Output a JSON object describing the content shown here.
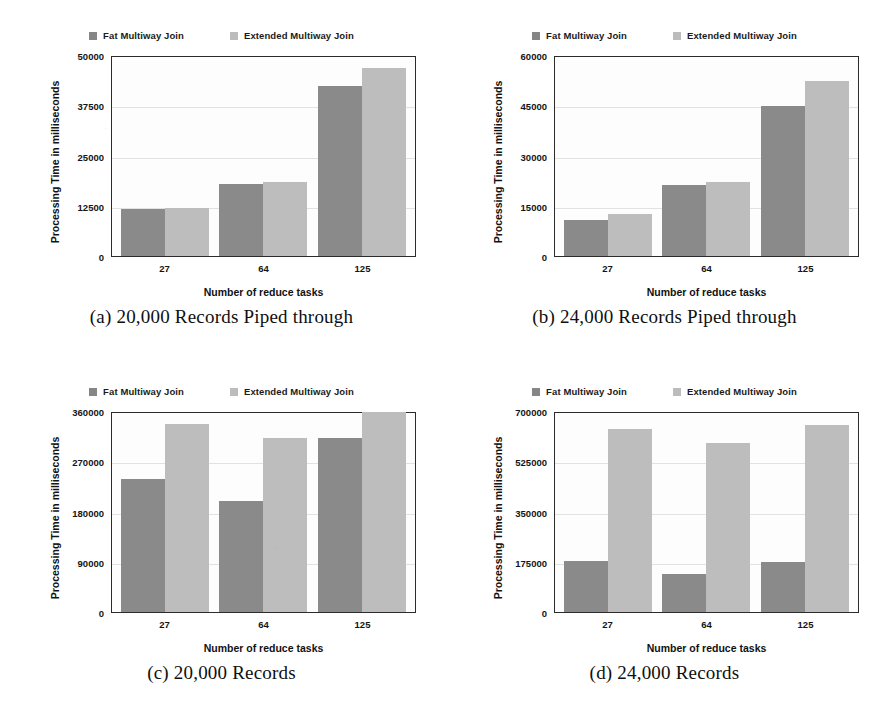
{
  "figure": {
    "legend": [
      {
        "label": "Fat Multiway Join",
        "swatch": "legend-swatch-dark",
        "color": "#868686"
      },
      {
        "label": "Extended Multiway Join",
        "swatch": "legend-swatch-light",
        "color": "#bcbcbc"
      }
    ],
    "axis_titles": {
      "x": "Number of reduce tasks",
      "y": "Processing Time in milliseconds"
    }
  },
  "chart_data": [
    {
      "id": "a",
      "type": "bar",
      "title": "(a) 20,000 Records Piped through",
      "caption": "(a) 20,000 Records Piped through",
      "xlabel": "Number of reduce tasks",
      "ylabel": "Processing Time in milliseconds",
      "categories": [
        "27",
        "64",
        "125"
      ],
      "yticks": [
        "50000",
        "37500",
        "25000",
        "12500",
        "0"
      ],
      "ytick_values": [
        50000,
        37500,
        25000,
        12500,
        0
      ],
      "ylim": [
        0,
        50000
      ],
      "grid": true,
      "legend_position": "top-center",
      "series": [
        {
          "name": "Fat Multiway Join",
          "color": "#8a8a8a",
          "values": [
            11800,
            17800,
            42200
          ]
        },
        {
          "name": "Extended Multiway Join",
          "color": "#bdbdbd",
          "values": [
            11900,
            18300,
            46700
          ]
        }
      ]
    },
    {
      "id": "b",
      "type": "bar",
      "title": "(b) 24,000 Records Piped through",
      "caption": "(b) 24,000 Records Piped through",
      "xlabel": "Number of reduce tasks",
      "ylabel": "Processing Time in milliseconds",
      "categories": [
        "27",
        "64",
        "125"
      ],
      "yticks": [
        "60000",
        "45000",
        "30000",
        "15000",
        "0"
      ],
      "ytick_values": [
        60000,
        45000,
        30000,
        15000,
        0
      ],
      "ylim": [
        0,
        60000
      ],
      "grid": true,
      "legend_position": "top-center",
      "series": [
        {
          "name": "Fat Multiway Join",
          "color": "#8a8a8a",
          "values": [
            10800,
            21200,
            44700
          ]
        },
        {
          "name": "Extended Multiway Join",
          "color": "#bdbdbd",
          "values": [
            12600,
            22200,
            52200
          ]
        }
      ]
    },
    {
      "id": "c",
      "type": "bar",
      "title": "(c) 20,000 Records",
      "caption": "(c) 20,000 Records",
      "xlabel": "Number of reduce tasks",
      "ylabel": "Processing Time in milliseconds",
      "categories": [
        "27",
        "64",
        "125"
      ],
      "yticks": [
        "360000",
        "270000",
        "180000",
        "90000",
        "0"
      ],
      "ytick_values": [
        360000,
        270000,
        180000,
        90000,
        0
      ],
      "ylim": [
        0,
        360000
      ],
      "grid": true,
      "legend_position": "top-center",
      "series": [
        {
          "name": "Fat Multiway Join",
          "color": "#8a8a8a",
          "values": [
            238000,
            198000,
            311000
          ]
        },
        {
          "name": "Extended Multiway Join",
          "color": "#bdbdbd",
          "values": [
            337000,
            312000,
            358000
          ]
        }
      ]
    },
    {
      "id": "d",
      "type": "bar",
      "title": "(d) 24,000 Records",
      "caption": "(d) 24,000 Records",
      "xlabel": "Number of reduce tasks",
      "ylabel": "Processing Time in milliseconds",
      "categories": [
        "27",
        "64",
        "125"
      ],
      "yticks": [
        "700000",
        "525000",
        "350000",
        "175000",
        "0"
      ],
      "ytick_values": [
        700000,
        525000,
        350000,
        175000,
        0
      ],
      "ylim": [
        0,
        700000
      ],
      "grid": true,
      "legend_position": "top-center",
      "series": [
        {
          "name": "Fat Multiway Join",
          "color": "#8a8a8a",
          "values": [
            177000,
            133000,
            173000
          ]
        },
        {
          "name": "Extended Multiway Join",
          "color": "#bdbdbd",
          "values": [
            637000,
            588000,
            650000
          ]
        }
      ]
    }
  ]
}
